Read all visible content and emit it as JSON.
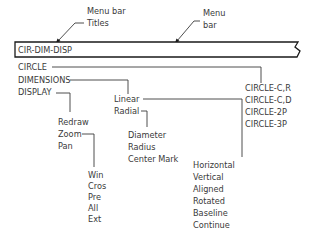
{
  "annotations": {
    "menu_bar_titles": [
      "Menu  bar",
      "Titles"
    ],
    "menu_bar": [
      "Menu",
      "bar"
    ]
  },
  "menu_bar": {
    "title": "CIR-DIM-DISP"
  },
  "menus": {
    "circle": {
      "label": "CIRCLE",
      "items": [
        "CIRCLE-C,R",
        "CIRCLE-C,D",
        "CIRCLE-2P",
        "CIRCLE-3P"
      ]
    },
    "dimensions": {
      "label": "DIMENSIONS",
      "items": [
        "Linear",
        "Radial"
      ],
      "linear": {
        "items": [
          "Horizontal",
          "Vertical",
          "Aligned",
          "Rotated",
          "Baseline",
          "Continue"
        ]
      },
      "radial": {
        "items": [
          "Diameter",
          "Radius",
          "Center  Mark"
        ]
      }
    },
    "display": {
      "label": "DISPLAY",
      "items": [
        "Redraw",
        "Zoom",
        "Pan"
      ],
      "zoom": {
        "items": [
          "Win",
          "Cros",
          "Pre",
          "All",
          "Ext"
        ]
      }
    }
  }
}
